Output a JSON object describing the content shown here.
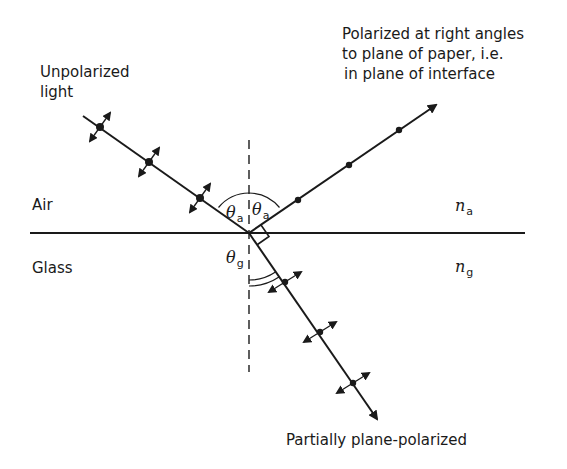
{
  "diagram": {
    "labels": {
      "incident": [
        "Unpolarized",
        "light"
      ],
      "reflected": [
        "Polarized at right angles",
        "to plane of paper, i.e.",
        "in plane of interface"
      ],
      "refracted": "Partially plane-polarized",
      "upper_medium": "Air",
      "lower_medium": "Glass",
      "upper_index_symbol": "n",
      "upper_index_sub": "a",
      "lower_index_symbol": "n",
      "lower_index_sub": "g",
      "angle_incident_symbol": "θ",
      "angle_incident_sub": "a",
      "angle_reflected_symbol": "θ",
      "angle_reflected_sub": "a",
      "angle_refracted_symbol": "θ",
      "angle_refracted_sub": "g"
    },
    "geometry": {
      "interface_y": 233,
      "interface_x": [
        30,
        525
      ],
      "normal_x": 249,
      "normal_y": [
        140,
        372
      ],
      "origin": [
        249,
        233
      ],
      "incident_start": [
        83,
        116
      ],
      "incident_markers": [
        [
          100,
          127
        ],
        [
          149,
          162
        ],
        [
          200,
          198
        ]
      ],
      "reflected_end": [
        437,
        104
      ],
      "reflected_dots": [
        [
          298,
          200
        ],
        [
          349,
          165
        ],
        [
          399,
          130
        ]
      ],
      "refracted_end": [
        378,
        420
      ],
      "refracted_markers": [
        [
          285,
          282
        ],
        [
          320,
          332
        ],
        [
          353,
          383
        ]
      ],
      "right_angle_mark": true
    },
    "colors": {
      "ink": "#1a1a1a",
      "background": "#ffffff"
    }
  }
}
